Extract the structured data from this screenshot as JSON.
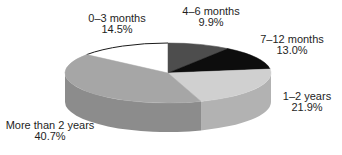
{
  "chart_data": {
    "type": "pie",
    "style": "3d-exploded-none-grayscale",
    "title": "",
    "legend_position": "none",
    "labels_position": "outside",
    "rotation_deg": -52.2,
    "direction": "clockwise-from-top",
    "categories": [
      "0–3 months",
      "4–6 months",
      "7–12 months",
      "1–2 years",
      "More than 2 years"
    ],
    "values": [
      14.5,
      9.9,
      13.0,
      21.9,
      40.7
    ],
    "unit": "%",
    "slices": [
      {
        "label": "0–3 months",
        "value": 14.5,
        "display": "14.5%",
        "color": "#ffffff",
        "side": "#e8e8e8",
        "outline": "#1a1a1a"
      },
      {
        "label": "4–6 months",
        "value": 9.9,
        "display": "9.9%",
        "color": "#4d4d4d",
        "side": "#3c3c3c"
      },
      {
        "label": "7–12 months",
        "value": 13.0,
        "display": "13.0%",
        "color": "#0d0d0d",
        "side": "#000000"
      },
      {
        "label": "1–2 years",
        "value": 21.9,
        "display": "21.9%",
        "color": "#d0d0d0",
        "side": "#b2b2b2"
      },
      {
        "label": "More than 2 years",
        "value": 40.7,
        "display": "40.7%",
        "color": "#a6a6a6",
        "side": "#8c8c8c"
      }
    ],
    "text_color": "#1e1e1e",
    "background_color": "#ffffff"
  }
}
